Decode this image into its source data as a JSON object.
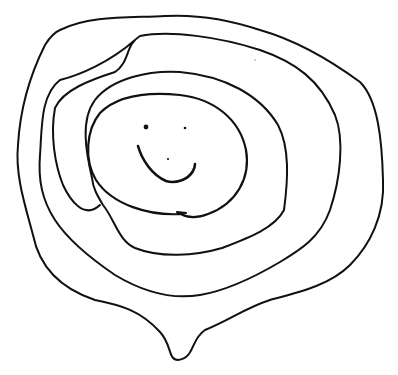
{
  "drawing": {
    "description": "Hand-drawn spiral doodle with a smiley face in the center",
    "background": "#ffffff",
    "ink_color": "#111111",
    "loops": [
      {
        "name": "inner-face-loop",
        "width": 2.2,
        "d": "M181,214 C150,216 112,205 96,180 C84,160 86,130 100,113 C118,95 150,92 180,95 C215,99 240,120 246,150 C251,178 236,204 208,214 C198,218 188,218 181,214 L177,212 L186,213"
      },
      {
        "name": "second-loop",
        "width": 2,
        "d": "M92,178 C86,152 80,120 95,100 C112,78 150,70 180,72 C225,76 260,95 278,125 C290,148 288,180 284,210 C275,228 248,238 222,248 C195,256 160,258 135,248 C118,240 115,220 103,205 C97,195 93,188 92,178"
      },
      {
        "name": "third-loop",
        "width": 2,
        "d": "M100,205 C84,220 70,200 63,185 C55,165 50,135 55,108 C63,90 90,80 115,72 C130,62 125,45 140,36 C170,30 220,37 260,50 C295,62 320,80 335,115 C345,140 340,180 330,210 C320,238 300,250 280,262 C258,275 230,290 200,295 C170,300 140,290 115,275 C90,258 68,240 55,220 C42,200 38,180 40,155 C42,130 40,95 60,80 C80,75 110,62 135,40"
      },
      {
        "name": "outer-loop",
        "width": 2,
        "d": "M60,30 C90,15 130,18 165,16 C200,14 230,20 260,30 C295,40 330,60 360,82 C378,100 382,140 383,180 C385,215 370,245 350,265 C330,285 300,292 270,300 C245,308 230,320 205,330 C190,340 195,358 178,360 C168,360 172,345 160,332 C140,310 120,305 95,300 C65,290 40,270 33,235 C25,205 15,175 18,145 C20,110 30,75 45,45 C50,37 55,32 60,30"
      }
    ],
    "face": {
      "left_eye": {
        "cx": 146,
        "cy": 127,
        "r": 2.4
      },
      "right_eye": {
        "cx": 185,
        "cy": 128,
        "r": 1.3
      },
      "nose": {
        "cx": 168,
        "cy": 159,
        "r": 1.1
      },
      "mouth": {
        "width": 2.6,
        "d": "M138,146 C142,160 152,175 166,181 C175,184 188,180 193,171 C195,167 195,164 195,164"
      }
    },
    "specks": [
      {
        "cx": 255,
        "cy": 60,
        "r": 0.7
      }
    ]
  }
}
